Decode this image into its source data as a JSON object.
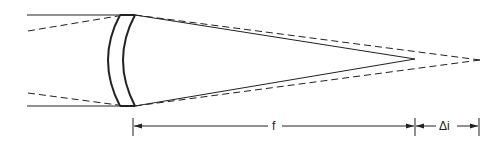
{
  "diagram": {
    "labels": {
      "focal_length": "f",
      "image_shift": "Δi"
    },
    "colors": {
      "line": "#222222",
      "background": "#ffffff"
    }
  }
}
